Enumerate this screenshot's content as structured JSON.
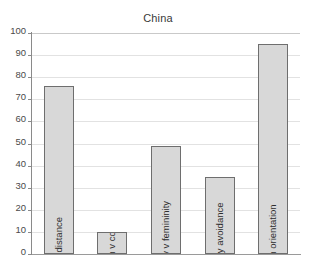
{
  "chart_data": {
    "type": "bar",
    "title": "China",
    "xlabel": "",
    "ylabel": "",
    "ylim": [
      0,
      100
    ],
    "yticks": [
      0,
      10,
      20,
      30,
      40,
      50,
      60,
      70,
      80,
      90,
      100
    ],
    "ytick_labels": [
      "0",
      "10",
      "20",
      "30",
      "40",
      "50",
      "60",
      "70",
      "80",
      "90",
      "100"
    ],
    "grid": true,
    "legend": false,
    "orientation": "vertical",
    "categories": [
      "Power distance",
      "Individualism v collectivism",
      "Masculinity v femininity",
      "Uncertainty avoidance",
      "Long-term orientation"
    ],
    "values": [
      76,
      10,
      49,
      35,
      95
    ],
    "bar_fill_color": "#d8d8d8",
    "bar_border_color": "#6e6e6e",
    "gridline_color": "#e2e2e2",
    "axis_color": "#8a8a8a",
    "background_color": "#ffffff",
    "label_placement": "inside-rotated"
  }
}
